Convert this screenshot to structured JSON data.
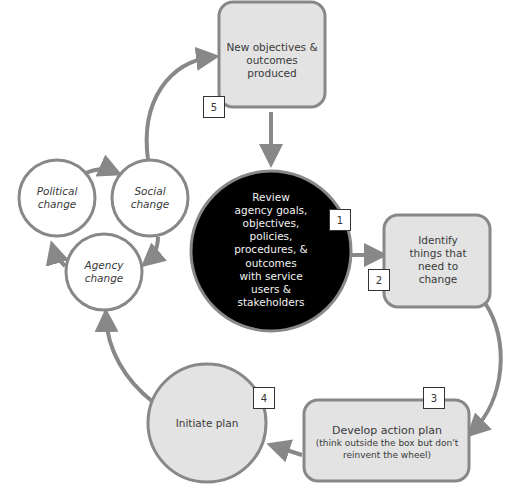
{
  "diagram": {
    "type": "cyclic process",
    "colors": {
      "stroke": "#888888",
      "box_fill": "#e3e3e3",
      "center_fill": "#000000",
      "center_text": "#f2f2f2",
      "text": "#3a3a3a"
    },
    "nodes": {
      "review": {
        "step": "1",
        "lines": [
          "Review",
          "agency goals,",
          "objectives,",
          "policies,",
          "procedures, &",
          "outcomes",
          "with service",
          "users &",
          "stakeholders"
        ]
      },
      "identify": {
        "step": "2",
        "lines": [
          "Identify",
          "things that",
          "need to",
          "change"
        ]
      },
      "develop": {
        "step": "3",
        "title": "Develop action plan",
        "subtitle_lines": [
          "(think outside the box but don't",
          "reinvent the wheel)"
        ]
      },
      "initiate": {
        "step": "4",
        "lines": [
          "Initiate plan"
        ]
      },
      "new_objectives": {
        "step": "5",
        "lines": [
          "New objectives &",
          "outcomes",
          "produced"
        ]
      },
      "political": {
        "lines": [
          "Political",
          "change"
        ]
      },
      "social": {
        "lines": [
          "Social",
          "change"
        ]
      },
      "agency": {
        "lines": [
          "Agency",
          "change"
        ]
      }
    },
    "edges": [
      [
        "new_objectives",
        "review"
      ],
      [
        "review",
        "identify"
      ],
      [
        "identify",
        "develop"
      ],
      [
        "develop",
        "initiate"
      ],
      [
        "initiate",
        "agency"
      ],
      [
        "agency",
        "political"
      ],
      [
        "political",
        "social"
      ],
      [
        "social",
        "agency"
      ],
      [
        "social",
        "new_objectives"
      ]
    ]
  }
}
